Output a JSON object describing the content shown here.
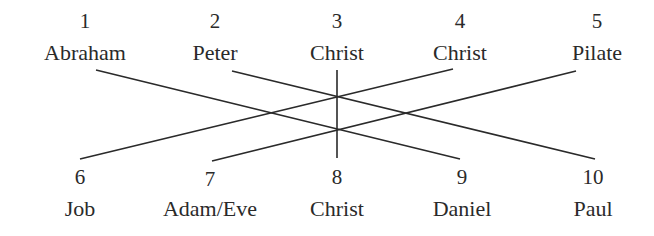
{
  "top_row": [
    {
      "number": "1",
      "name": "Abraham",
      "x": 85
    },
    {
      "number": "2",
      "name": "Peter",
      "x": 215
    },
    {
      "number": "3",
      "name": "Christ",
      "x": 337
    },
    {
      "number": "4",
      "name": "Christ",
      "x": 460
    },
    {
      "number": "5",
      "name": "Pilate",
      "x": 597
    }
  ],
  "bottom_row": [
    {
      "number": "6",
      "name": "Job",
      "x": 80
    },
    {
      "number": "7",
      "name": "Adam/Eve",
      "x": 210
    },
    {
      "number": "8",
      "name": "Christ",
      "x": 337
    },
    {
      "number": "9",
      "name": "Daniel",
      "x": 462
    },
    {
      "number": "10",
      "name": "Paul",
      "x": 593
    }
  ],
  "connections": [
    {
      "from": "1 Abraham",
      "to": "9 Daniel",
      "x1": 96,
      "y1": 70,
      "x2": 460,
      "y2": 159
    },
    {
      "from": "2 Peter",
      "to": "10 Paul",
      "x1": 232,
      "y1": 71,
      "x2": 595,
      "y2": 159
    },
    {
      "from": "3 Christ",
      "to": "8 Christ",
      "x1": 337,
      "y1": 70,
      "x2": 337,
      "y2": 158
    },
    {
      "from": "4 Christ",
      "to": "6 Job",
      "x1": 453,
      "y1": 69,
      "x2": 80,
      "y2": 159
    },
    {
      "from": "5 Pilate",
      "to": "7 Adam/Eve",
      "x1": 576,
      "y1": 71,
      "x2": 212,
      "y2": 161
    }
  ],
  "line_color": "#2a2a2a"
}
